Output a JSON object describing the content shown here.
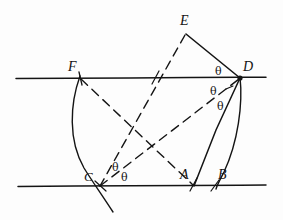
{
  "figure": {
    "background_color": "#fdfdfd",
    "ink_color": "#141414",
    "width": 283,
    "height": 220,
    "lines": {
      "top_parallel": {
        "name": "upper parallel line",
        "x1": 16,
        "y1": 78,
        "x2": 266,
        "y2": 77
      },
      "bottom_parallel": {
        "name": "lower parallel line",
        "x1": 18,
        "y1": 186,
        "x2": 266,
        "y2": 185
      }
    },
    "points": [
      {
        "id": "E",
        "label": "E",
        "x": 186,
        "y": 33,
        "label_x": 180,
        "label_y": 14,
        "on": "apex"
      },
      {
        "id": "D",
        "label": "D",
        "x": 240,
        "y": 78,
        "label_x": 243,
        "label_y": 60,
        "on": "top_parallel"
      },
      {
        "id": "F",
        "label": "F",
        "x": 80,
        "y": 78,
        "label_x": 68,
        "label_y": 60,
        "on": "top_parallel"
      },
      {
        "id": "C",
        "label": "C",
        "x": 100,
        "y": 186,
        "label_x": 84,
        "label_y": 170,
        "on": "bottom_parallel"
      },
      {
        "id": "A",
        "label": "A",
        "x": 193,
        "y": 185,
        "label_x": 180,
        "label_y": 168,
        "on": "bottom_parallel"
      },
      {
        "id": "B",
        "label": "B",
        "x": 215,
        "y": 186,
        "label_x": 218,
        "label_y": 168,
        "on": "bottom_parallel"
      }
    ],
    "solid_segments": [
      {
        "name": "segment-E-D",
        "from": "E",
        "to": "D"
      },
      {
        "name": "segment-D-A",
        "from": "D",
        "to": "A"
      }
    ],
    "dashed_segments": [
      {
        "name": "segment-E-C",
        "from": "E",
        "to": "C"
      },
      {
        "name": "segment-F-A",
        "from": "F",
        "to": "A"
      },
      {
        "name": "segment-C-D",
        "from": "C",
        "to": "D"
      }
    ],
    "arcs": [
      {
        "name": "arc-F-C",
        "from": "F",
        "to": "C",
        "bow": "left",
        "extends_below": true
      },
      {
        "name": "arc-D-B",
        "from": "D",
        "to": "B",
        "bow": "right"
      }
    ],
    "angle_marks": [
      {
        "id": "theta-D-upper",
        "label": "θ",
        "x": 215,
        "y": 66,
        "at_point": "D"
      },
      {
        "id": "theta-D-middle",
        "label": "θ",
        "x": 210,
        "y": 86,
        "at_point": "D"
      },
      {
        "id": "theta-D-lower",
        "label": "θ",
        "x": 217,
        "y": 101,
        "at_point": "D"
      },
      {
        "id": "theta-C-upper",
        "label": "θ",
        "x": 112,
        "y": 162,
        "at_point": "C"
      },
      {
        "id": "theta-C-lower",
        "label": "θ",
        "x": 121,
        "y": 172,
        "at_point": "C"
      }
    ],
    "tick_marks": [
      {
        "name": "tick-F",
        "x": 80,
        "y": 78
      },
      {
        "name": "tick-top-mid",
        "x": 155,
        "y": 78
      },
      {
        "name": "tick-C",
        "x": 100,
        "y": 186
      },
      {
        "name": "tick-A",
        "x": 193,
        "y": 185
      },
      {
        "name": "tick-B",
        "x": 215,
        "y": 186
      }
    ]
  }
}
